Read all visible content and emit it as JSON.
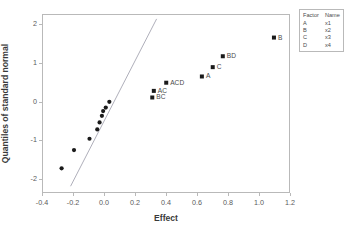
{
  "chart_data": {
    "type": "scatter",
    "title": "",
    "xlabel": "Effect",
    "ylabel": "Quantiles of standard normal",
    "xlim": [
      -0.4,
      1.2
    ],
    "ylim": [
      -2.35,
      2.25
    ],
    "xticks": [
      "-0.4",
      "-0.2",
      "0.0",
      "0.2",
      "0.4",
      "0.6",
      "0.8",
      "1.0",
      "1.2"
    ],
    "xtick_values": [
      -0.4,
      -0.2,
      0.0,
      0.2,
      0.4,
      0.6,
      0.8,
      1.0,
      1.2
    ],
    "yticks": [
      "2",
      "1",
      "0",
      "-1",
      "-2"
    ],
    "ytick_values": [
      2,
      1,
      0,
      -1,
      -2
    ],
    "grid": false,
    "legend_position": "outside-top-right",
    "points": [
      {
        "label": "",
        "x": -0.28,
        "y": -1.69,
        "marker": "circle"
      },
      {
        "label": "",
        "x": -0.2,
        "y": -1.22,
        "marker": "circle"
      },
      {
        "label": "",
        "x": -0.1,
        "y": -0.93,
        "marker": "circle"
      },
      {
        "label": "",
        "x": -0.05,
        "y": -0.69,
        "marker": "circle"
      },
      {
        "label": "",
        "x": -0.035,
        "y": -0.51,
        "marker": "circle"
      },
      {
        "label": "",
        "x": -0.02,
        "y": -0.34,
        "marker": "circle"
      },
      {
        "label": "",
        "x": -0.012,
        "y": -0.22,
        "marker": "circle"
      },
      {
        "label": "",
        "x": 0.005,
        "y": -0.13,
        "marker": "circle"
      },
      {
        "label": "",
        "x": 0.028,
        "y": 0.02,
        "marker": "circle"
      },
      {
        "label": "BC",
        "x": 0.305,
        "y": 0.13,
        "marker": "square"
      },
      {
        "label": "AC",
        "x": 0.315,
        "y": 0.3,
        "marker": "square"
      },
      {
        "label": "ACD",
        "x": 0.395,
        "y": 0.51,
        "marker": "square"
      },
      {
        "label": "A",
        "x": 0.625,
        "y": 0.67,
        "marker": "square"
      },
      {
        "label": "C",
        "x": 0.695,
        "y": 0.91,
        "marker": "square"
      },
      {
        "label": "BD",
        "x": 0.76,
        "y": 1.19,
        "marker": "square"
      },
      {
        "label": "B",
        "x": 1.09,
        "y": 1.67,
        "marker": "square"
      }
    ],
    "reference_line": {
      "x1": -0.222,
      "y1": -2.15,
      "x2": 0.333,
      "y2": 2.15
    },
    "series_color": "#1a1a1a",
    "line_color": "#9a9aa8",
    "frame_color": "#b9b9b9"
  },
  "legend": {
    "headers": {
      "factor": "Factor",
      "name": "Name"
    },
    "rows": [
      {
        "factor": "A",
        "name": "x1"
      },
      {
        "factor": "B",
        "name": "x2"
      },
      {
        "factor": "C",
        "name": "x3"
      },
      {
        "factor": "D",
        "name": "x4"
      }
    ]
  }
}
